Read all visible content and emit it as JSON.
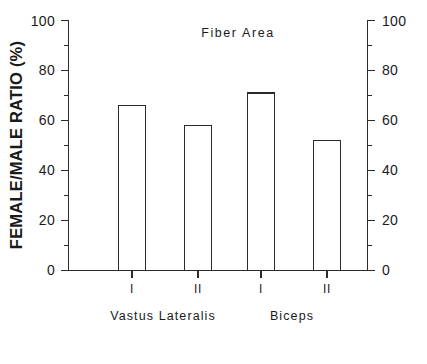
{
  "chart_data": {
    "type": "bar",
    "title": "Fiber Area",
    "xlabel": "",
    "ylabel": "FEMALE/MALE RATIO (%)",
    "ylim": [
      0,
      100
    ],
    "ytick_labels": [
      "0",
      "20",
      "40",
      "60",
      "80",
      "100"
    ],
    "ytick_values": [
      0,
      20,
      40,
      60,
      80,
      100
    ],
    "y_minor_step": 10,
    "right_axis_labels": [
      "0",
      "20",
      "40",
      "60",
      "80",
      "100"
    ],
    "grid": false,
    "legend": false,
    "categories": [
      "I",
      "II",
      "I",
      "II"
    ],
    "values": [
      66,
      58,
      71,
      52
    ],
    "groups": [
      {
        "label": "Vastus Lateralis",
        "categories": [
          "I",
          "II"
        ],
        "values": [
          66,
          58
        ]
      },
      {
        "label": "Biceps",
        "categories": [
          "I",
          "II"
        ],
        "values": [
          71,
          52
        ]
      }
    ],
    "bar_style": {
      "fill": "#ffffff",
      "edge": "#2b2b2b"
    }
  },
  "figure": {
    "background": "#ffffff",
    "foreground": "#1a1a1a"
  }
}
